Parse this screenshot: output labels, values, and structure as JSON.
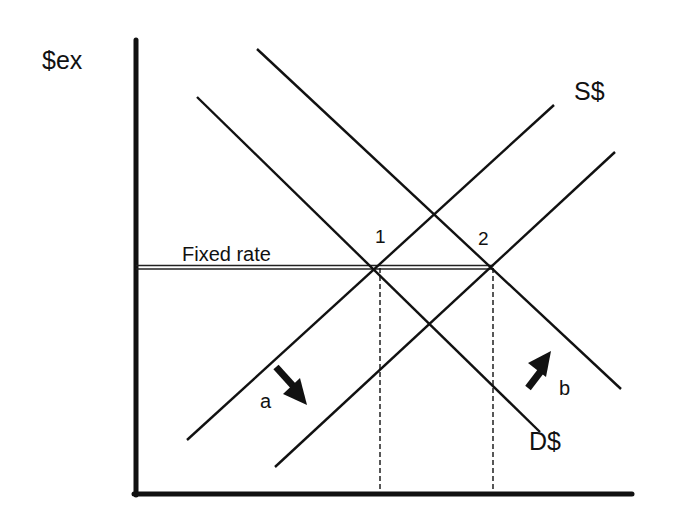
{
  "diagram": {
    "y_axis_label": "$ex",
    "fixed_rate_label": "Fixed rate",
    "supply_label": "S$",
    "demand_label": "D$",
    "points": [
      {
        "id": "1",
        "label": "1"
      },
      {
        "id": "2",
        "label": "2"
      }
    ],
    "shifts": [
      {
        "id": "a",
        "label": "a",
        "direction": "down-right",
        "curve": "supply"
      },
      {
        "id": "b",
        "label": "b",
        "direction": "up-right",
        "curve": "demand"
      }
    ],
    "colors": {
      "line": "#111111",
      "background": "#ffffff"
    }
  }
}
